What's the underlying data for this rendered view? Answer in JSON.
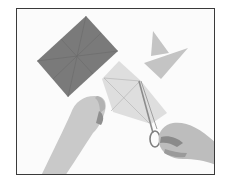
{
  "image": {
    "description": "Photo of two hands cutting a light gray square of paper with scissors; a dark gray creased rectangle lies upper left and two light gray triangular cut pieces lie upper right.",
    "frame_color": "#3a3a3a",
    "background_color": "#fbfbfb"
  },
  "objects": {
    "dark_sheet": {
      "label": "dark gray folded sheet",
      "color": "#7a7a7a"
    },
    "cut_pieces": {
      "label": "light gray triangle pieces",
      "color": "#c4c4c4"
    },
    "working_sheet": {
      "label": "light gray sheet being cut",
      "color": "#dedede"
    },
    "left_hand": {
      "label": "left hand holding paper",
      "color": "#c9c9c9"
    },
    "right_hand": {
      "label": "right hand with scissors",
      "color": "#bdbdbd"
    },
    "scissors": {
      "label": "scissors",
      "color": "#8c8c8c"
    }
  }
}
